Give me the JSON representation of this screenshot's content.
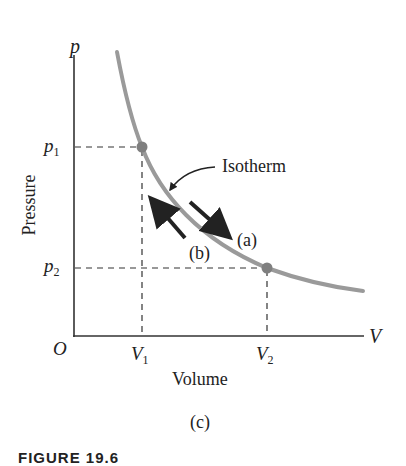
{
  "figure": {
    "panel_label": "(c)",
    "caption_partial": "FIGURE 19.6"
  },
  "axes": {
    "y_symbol": "p",
    "x_symbol": "V",
    "origin": "O",
    "y_label": "Pressure",
    "x_label": "Volume",
    "y_ticks": [
      {
        "base": "p",
        "sub": "1"
      },
      {
        "base": "p",
        "sub": "2"
      }
    ],
    "x_ticks": [
      {
        "base": "V",
        "sub": "1"
      },
      {
        "base": "V",
        "sub": "2"
      }
    ]
  },
  "annotations": {
    "curve_label": "Isotherm",
    "arrow_a": "(a)",
    "arrow_b": "(b)"
  },
  "colors": {
    "curve": "#9a9a9a",
    "point": "#7f7f7f",
    "axis": "#333333",
    "arrow": "#222222"
  }
}
